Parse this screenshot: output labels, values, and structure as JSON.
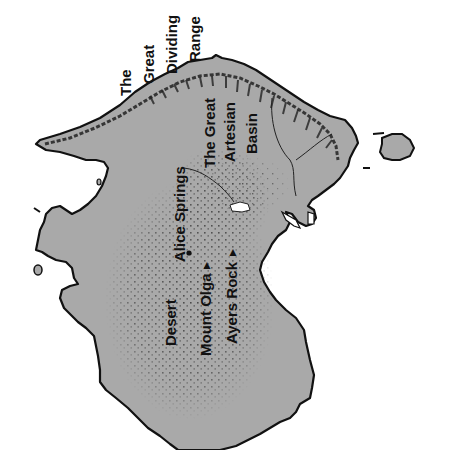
{
  "map": {
    "subject": "Australia (rotated, north to the left)",
    "colors": {
      "land": "#a9a9a9",
      "coast": "#111111",
      "background": "#ffffff",
      "stipple": "#333333",
      "lake": "#ffffff"
    },
    "labels": {
      "range_line1": "The",
      "range_line2": "Great",
      "range_line3": "Dividing",
      "range_line4": "Range",
      "basin_line1": "The Great",
      "basin_line2": "Artesian",
      "basin_line3": "Basin",
      "alice_springs": "Alice Springs",
      "desert": "Desert",
      "mount_olga": "Mount Olga",
      "ayers_rock": "Ayers Rock"
    },
    "symbols": {
      "city_marker": "●",
      "peak_marker": "▲"
    }
  }
}
